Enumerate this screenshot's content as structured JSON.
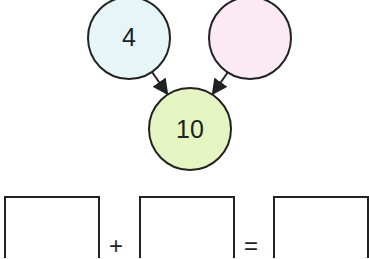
{
  "diagram": {
    "type": "number-bond",
    "circles": {
      "left": {
        "value": "4",
        "fill": "#e6f6f8"
      },
      "right": {
        "value": "",
        "fill": "#fbe9f4"
      },
      "whole": {
        "value": "10",
        "fill": "#e4f5c2"
      }
    },
    "stroke_color": "#222222"
  },
  "equation": {
    "boxes": [
      "",
      "",
      ""
    ],
    "plus": "+",
    "equals": "="
  }
}
